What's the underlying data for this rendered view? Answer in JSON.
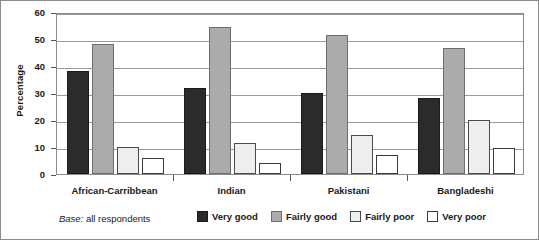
{
  "chart_data": {
    "type": "bar",
    "title": "",
    "xlabel": "",
    "ylabel": "Percentage",
    "ylim": [
      0,
      60
    ],
    "yticks": [
      0,
      10,
      20,
      30,
      40,
      50,
      60
    ],
    "grid": true,
    "legend_position": "bottom",
    "categories": [
      "African-Carribbean",
      "Indian",
      "Pakistani",
      "Bangladeshi"
    ],
    "series": [
      {
        "name": "Very good",
        "color": "#2b2b2b",
        "values": [
          38,
          32,
          30,
          28
        ]
      },
      {
        "name": "Fairly good",
        "color": "#ababab",
        "values": [
          48,
          54.5,
          51.5,
          46.5
        ]
      },
      {
        "name": "Fairly poor",
        "color": "#eeeeee",
        "values": [
          10,
          11.5,
          14.5,
          20
        ]
      },
      {
        "name": "Very poor",
        "color": "#ffffff",
        "values": [
          6,
          4,
          7,
          9.5
        ]
      }
    ],
    "annotations": [
      {
        "name": "base-note",
        "emphasis": "Base:",
        "text": " all respondents"
      }
    ]
  },
  "axis": {
    "ylabel": "Percentage",
    "tick_labels": [
      "60",
      "50",
      "40",
      "30",
      "20",
      "10",
      "0"
    ]
  },
  "footer": {
    "base_em": "Base:",
    "base_text": " all respondents"
  },
  "legend": {
    "items": [
      {
        "label": "Very good"
      },
      {
        "label": "Fairly good"
      },
      {
        "label": "Fairly poor"
      },
      {
        "label": "Very poor"
      }
    ]
  }
}
